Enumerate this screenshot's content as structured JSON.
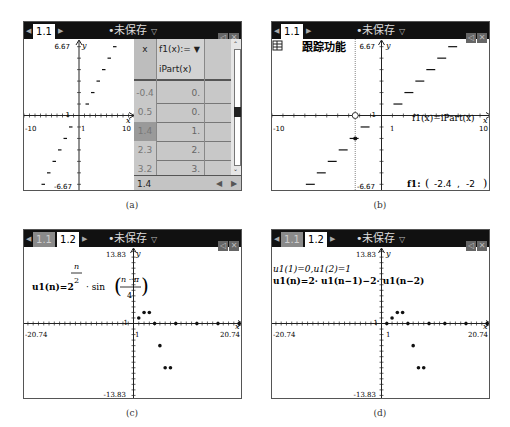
{
  "common": {
    "doc_title": "•未保存",
    "dropdown_icon": "chevron-down-icon",
    "window_buttons": [
      "speaker-icon",
      "close-icon"
    ]
  },
  "panels": {
    "a": {
      "caption": "(a)",
      "tabs": [
        {
          "label": "1.1",
          "active": true
        }
      ],
      "graph": {
        "ymax_label": "6.67",
        "ymin_label": "-6.67",
        "xmin_label": "-10",
        "xmax_label": "10",
        "x_tick_label": "1",
        "y_tick_label": "1",
        "x_axis_label": "x",
        "y_axis_label": "y"
      },
      "table": {
        "headers": [
          "x",
          "f1(x):="
        ],
        "header_menu_icon": "triangle-down-icon",
        "formula": "iPart(x)",
        "rows": [
          {
            "x": "-0.4",
            "f1": "0."
          },
          {
            "x": "0.5",
            "f1": "0."
          },
          {
            "x": "1.4",
            "f1": "1."
          },
          {
            "x": "2.3",
            "f1": "2."
          },
          {
            "x": "3.2",
            "f1": "3."
          }
        ],
        "entry_value": "1.4",
        "nav_left": "◀",
        "nav_right": "▶"
      }
    },
    "b": {
      "caption": "(b)",
      "tabs": [
        {
          "label": "1.1",
          "active": true
        }
      ],
      "trace_label": "跟踪功能",
      "function_label": "f1(x)=iPart(x)",
      "trace_readout": {
        "name": "f1:",
        "x": "-2.4",
        "y": "-2"
      },
      "graph": {
        "ymax_label": "6.67",
        "ymin_label": "-6.67",
        "xmin_label": "-10",
        "xmax_label": "10",
        "x_tick_label": "1",
        "y_tick_label": "1",
        "x_axis_label": "x",
        "y_axis_label": "y"
      }
    },
    "c": {
      "caption": "(c)",
      "tabs": [
        {
          "label": "1.1",
          "active": false
        },
        {
          "label": "1.2",
          "active": true
        }
      ],
      "formula": {
        "lhs": "u1(n)=2",
        "exp_num": "n",
        "exp_den": "2",
        "mid": "· sin",
        "frac_num": "n · π",
        "frac_den": "4"
      },
      "graph": {
        "ymax_label": "13.83",
        "ymin_label": "-13.83",
        "xmin_label": "-20.74",
        "xmax_label": "20.74",
        "x_tick_label": "1",
        "y_tick_label": "1",
        "x_axis_label": "x",
        "y_axis_label": "y"
      }
    },
    "d": {
      "caption": "(d)",
      "tabs": [
        {
          "label": "1.1",
          "active": false
        },
        {
          "label": "1.2",
          "active": true
        }
      ],
      "formula_line1": "u1(1)=0,u1(2)=1",
      "formula_line2": "u1(n)=2· u1(n−1)−2· u1(n−2)",
      "graph": {
        "ymax_label": "13.83",
        "ymin_label": "-13.83",
        "xmin_label": "-20.74",
        "xmax_label": "20.74",
        "x_tick_label": "1",
        "y_tick_label": "1",
        "x_axis_label": "x",
        "y_axis_label": "y"
      }
    }
  },
  "chart_data": [
    {
      "type": "line",
      "title": "f1(x)=iPart(x)",
      "xlim": [
        -10,
        10
      ],
      "ylim": [
        -6.67,
        6.67
      ],
      "segments": [
        {
          "x": [
            -7,
            -6
          ],
          "y": -6
        },
        {
          "x": [
            -6,
            -5
          ],
          "y": -5
        },
        {
          "x": [
            -5,
            -4
          ],
          "y": -4
        },
        {
          "x": [
            -4,
            -3
          ],
          "y": -3
        },
        {
          "x": [
            -3,
            -2
          ],
          "y": -2
        },
        {
          "x": [
            -2,
            -1
          ],
          "y": -1
        },
        {
          "x": [
            1,
            2
          ],
          "y": 1
        },
        {
          "x": [
            2,
            3
          ],
          "y": 2
        },
        {
          "x": [
            3,
            4
          ],
          "y": 3
        },
        {
          "x": [
            4,
            5
          ],
          "y": 4
        },
        {
          "x": [
            5,
            6
          ],
          "y": 5
        },
        {
          "x": [
            6,
            7
          ],
          "y": 6
        }
      ]
    },
    {
      "type": "line",
      "title": "f1(x)=iPart(x) trace",
      "xlim": [
        -10,
        10
      ],
      "ylim": [
        -6.67,
        6.67
      ],
      "trace_point": {
        "x": -2.4,
        "y": -2
      },
      "segments": [
        {
          "x": [
            -8,
            -7
          ],
          "y": -7
        },
        {
          "x": [
            -7,
            -6
          ],
          "y": -6
        },
        {
          "x": [
            -6,
            -5
          ],
          "y": -5
        },
        {
          "x": [
            -5,
            -4
          ],
          "y": -4
        },
        {
          "x": [
            -4,
            -3
          ],
          "y": -3
        },
        {
          "x": [
            -3,
            -2
          ],
          "y": -2
        },
        {
          "x": [
            -2,
            -1
          ],
          "y": -1
        },
        {
          "x": [
            1,
            2
          ],
          "y": 1
        },
        {
          "x": [
            2,
            3
          ],
          "y": 2
        },
        {
          "x": [
            3,
            4
          ],
          "y": 3
        },
        {
          "x": [
            4,
            5
          ],
          "y": 4
        },
        {
          "x": [
            5,
            6
          ],
          "y": 5
        },
        {
          "x": [
            6,
            7
          ],
          "y": 6
        }
      ]
    },
    {
      "type": "scatter",
      "title": "u1(n)=2^(n/2)·sin(nπ/4)",
      "xlim": [
        -20.74,
        20.74
      ],
      "ylim": [
        -13.83,
        13.83
      ],
      "x": [
        1,
        2,
        3,
        4,
        5,
        6,
        7,
        8,
        12,
        16,
        20
      ],
      "y": [
        1,
        2,
        2,
        0,
        -4,
        -8,
        -8,
        0,
        0,
        0,
        0
      ]
    },
    {
      "type": "scatter",
      "title": "u1(n)=2·u1(n−1)−2·u1(n−2)",
      "xlim": [
        -20.74,
        20.74
      ],
      "ylim": [
        -13.83,
        13.83
      ],
      "x": [
        1,
        2,
        3,
        4,
        5,
        6,
        7,
        8,
        9,
        12,
        16,
        20
      ],
      "y": [
        0,
        1,
        2,
        2,
        0,
        -4,
        -8,
        -8,
        0,
        0,
        0,
        0
      ]
    }
  ]
}
